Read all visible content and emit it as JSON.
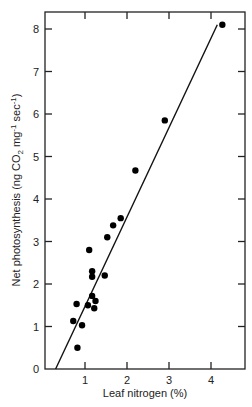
{
  "chart_data": {
    "type": "scatter",
    "title": "",
    "xlabel": "Leaf nitrogen (%)",
    "ylabel": "Net photosynthesis (ng CO2 mg-1 sec-1)",
    "ylabel_parts": {
      "pre": "Net photosynthesis (ng CO",
      "sub": "2",
      "mid": " mg",
      "sup1": "-1",
      "post": " sec",
      "sup2": "-1",
      "end": ")"
    },
    "xlim": [
      0,
      4.8
    ],
    "ylim": [
      0,
      8.5
    ],
    "x_ticks": [
      1,
      2,
      3,
      4
    ],
    "x_tick_labels": [
      "1",
      "2",
      "3",
      "4"
    ],
    "y_ticks": [
      0,
      1,
      2,
      3,
      4,
      5,
      6,
      7,
      8
    ],
    "y_tick_labels": [
      "0",
      "1",
      "2",
      "3",
      "4",
      "5",
      "6",
      "7",
      "8"
    ],
    "grid": false,
    "legend": null,
    "points": [
      {
        "x": 0.82,
        "y": 0.5
      },
      {
        "x": 0.72,
        "y": 1.13
      },
      {
        "x": 0.93,
        "y": 1.03
      },
      {
        "x": 0.8,
        "y": 1.53
      },
      {
        "x": 1.07,
        "y": 1.5
      },
      {
        "x": 1.17,
        "y": 1.72
      },
      {
        "x": 1.25,
        "y": 1.6
      },
      {
        "x": 1.22,
        "y": 1.43
      },
      {
        "x": 1.17,
        "y": 2.3
      },
      {
        "x": 1.17,
        "y": 2.17
      },
      {
        "x": 1.47,
        "y": 2.2
      },
      {
        "x": 1.1,
        "y": 2.8
      },
      {
        "x": 1.53,
        "y": 3.1
      },
      {
        "x": 1.67,
        "y": 3.38
      },
      {
        "x": 1.85,
        "y": 3.55
      },
      {
        "x": 2.2,
        "y": 4.67
      },
      {
        "x": 2.9,
        "y": 5.85
      },
      {
        "x": 4.27,
        "y": 8.1
      }
    ],
    "fit_line": {
      "x1": 0.3,
      "y1": 0,
      "x2": 4.15,
      "y2": 8.1
    }
  }
}
